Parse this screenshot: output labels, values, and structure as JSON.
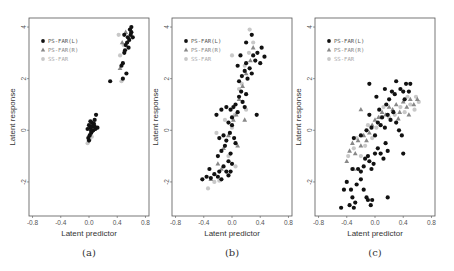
{
  "figure": {
    "panels": [
      {
        "caption": "(a)"
      },
      {
        "caption": "(b)"
      },
      {
        "caption": "(c)"
      }
    ]
  },
  "chart_data": [
    {
      "type": "scatter",
      "title": "(a)",
      "xlabel": "Latent predictor",
      "ylabel": "Latent response",
      "xlim": [
        -0.85,
        0.85
      ],
      "ylim": [
        -3.32,
        4.35
      ],
      "xticks": [
        -0.8,
        -0.4,
        0.0,
        0.4,
        0.8
      ],
      "yticks": [
        -2,
        0,
        2,
        4
      ],
      "grid": false,
      "legend_position": "upper-left",
      "legend": [
        "PS-FAR(L)",
        "PS-FAR(R)",
        "SS-FAR"
      ],
      "series": [
        {
          "name": "PS-FAR(L)",
          "marker": "circle",
          "color": "#111111",
          "points": [
            [
              0.0,
              0.2
            ],
            [
              0.02,
              0.1
            ],
            [
              0.04,
              0.3
            ],
            [
              0.06,
              0.0
            ],
            [
              0.08,
              0.4
            ],
            [
              0.1,
              0.6
            ],
            [
              0.01,
              -0.2
            ],
            [
              0.03,
              -0.1
            ],
            [
              0.05,
              0.15
            ],
            [
              0.07,
              0.25
            ],
            [
              0.0,
              -0.4
            ],
            [
              -0.02,
              0.05
            ],
            [
              0.09,
              0.05
            ],
            [
              0.12,
              0.1
            ],
            [
              0.02,
              0.35
            ],
            [
              0.04,
              -0.05
            ],
            [
              0.06,
              0.2
            ],
            [
              0.08,
              0.15
            ],
            [
              -0.01,
              -0.3
            ],
            [
              0.03,
              0.0
            ],
            [
              0.3,
              1.9
            ],
            [
              0.46,
              2.5
            ],
            [
              0.48,
              2.0
            ],
            [
              0.5,
              3.0
            ],
            [
              0.52,
              3.3
            ],
            [
              0.55,
              3.6
            ],
            [
              0.58,
              3.9
            ],
            [
              0.6,
              3.8
            ],
            [
              0.54,
              3.4
            ],
            [
              0.5,
              3.7
            ],
            [
              0.56,
              3.2
            ],
            [
              0.62,
              3.6
            ],
            [
              0.48,
              2.6
            ],
            [
              0.53,
              2.2
            ],
            [
              0.57,
              3.5
            ],
            [
              0.6,
              4.0
            ],
            [
              0.51,
              3.1
            ],
            [
              0.59,
              3.7
            ]
          ]
        },
        {
          "name": "PS-FAR(R)",
          "marker": "triangle",
          "color": "#888888",
          "points": [
            [
              0.0,
              -0.2
            ],
            [
              0.02,
              0.15
            ],
            [
              0.05,
              0.0
            ],
            [
              0.44,
              2.4
            ],
            [
              0.47,
              3.4
            ],
            [
              0.52,
              3.8
            ]
          ]
        },
        {
          "name": "SS-FAR",
          "marker": "circle",
          "color": "#c8c8c8",
          "points": [
            [
              -0.02,
              -0.5
            ],
            [
              0.01,
              -0.35
            ],
            [
              0.04,
              -0.25
            ],
            [
              0.42,
              3.7
            ],
            [
              0.44,
              2.9
            ],
            [
              0.46,
              1.9
            ],
            [
              0.49,
              3.3
            ]
          ]
        }
      ]
    },
    {
      "type": "scatter",
      "title": "(b)",
      "xlabel": "Latent predictor",
      "ylabel": "Latent response",
      "xlim": [
        -0.85,
        0.85
      ],
      "ylim": [
        -3.32,
        4.35
      ],
      "xticks": [
        -0.8,
        -0.4,
        0.0,
        0.4,
        0.8
      ],
      "yticks": [
        -2,
        0,
        2,
        4
      ],
      "grid": false,
      "legend_position": "upper-left",
      "legend": [
        "PS-FAR(L)",
        "PS-FAR(R)",
        "SS-FAR"
      ],
      "series": [
        {
          "name": "PS-FAR(L)",
          "marker": "circle",
          "color": "#111111",
          "points": [
            [
              -0.42,
              -1.9
            ],
            [
              -0.36,
              -1.8
            ],
            [
              -0.32,
              -1.5
            ],
            [
              -0.3,
              -1.85
            ],
            [
              -0.25,
              -1.7
            ],
            [
              -0.2,
              -1.8
            ],
            [
              -0.18,
              -1.6
            ],
            [
              -0.15,
              -1.9
            ],
            [
              -0.12,
              -1.4
            ],
            [
              -0.08,
              -1.6
            ],
            [
              -0.05,
              -1.75
            ],
            [
              -0.2,
              -1.0
            ],
            [
              -0.15,
              -0.8
            ],
            [
              -0.1,
              -0.6
            ],
            [
              -0.05,
              -1.2
            ],
            [
              -0.02,
              -0.9
            ],
            [
              -0.18,
              -0.3
            ],
            [
              -0.12,
              -0.2
            ],
            [
              -0.08,
              -0.4
            ],
            [
              -0.03,
              -0.1
            ],
            [
              0.0,
              0.2
            ],
            [
              0.03,
              -0.3
            ],
            [
              -0.22,
              0.6
            ],
            [
              -0.15,
              0.8
            ],
            [
              -0.08,
              0.9
            ],
            [
              -0.02,
              0.8
            ],
            [
              0.02,
              0.9
            ],
            [
              0.05,
              1.0
            ],
            [
              0.08,
              0.7
            ],
            [
              0.1,
              1.3
            ],
            [
              0.13,
              1.5
            ],
            [
              0.15,
              1.1
            ],
            [
              0.18,
              0.9
            ],
            [
              0.2,
              1.4
            ],
            [
              0.1,
              1.9
            ],
            [
              0.14,
              2.1
            ],
            [
              0.18,
              2.3
            ],
            [
              0.22,
              2.0
            ],
            [
              0.25,
              2.4
            ],
            [
              0.2,
              2.6
            ],
            [
              0.28,
              2.2
            ],
            [
              0.3,
              2.9
            ],
            [
              0.33,
              2.7
            ],
            [
              0.36,
              3.0
            ],
            [
              0.4,
              2.6
            ],
            [
              0.42,
              3.2
            ],
            [
              0.46,
              2.85
            ],
            [
              0.28,
              3.7
            ],
            [
              0.2,
              3.4
            ],
            [
              0.08,
              2.5
            ],
            [
              0.12,
              2.9
            ],
            [
              0.35,
              0.6
            ],
            [
              0.0,
              0.5
            ],
            [
              -0.05,
              0.3
            ],
            [
              0.05,
              -0.5
            ],
            [
              0.0,
              -1.3
            ],
            [
              -0.02,
              -1.6
            ]
          ]
        },
        {
          "name": "PS-FAR(R)",
          "marker": "triangle",
          "color": "#888888",
          "points": [
            [
              -0.3,
              -1.9
            ],
            [
              -0.2,
              -1.3
            ],
            [
              -0.12,
              -0.7
            ],
            [
              -0.05,
              -0.2
            ],
            [
              0.02,
              0.4
            ],
            [
              0.06,
              0.6
            ],
            [
              0.1,
              1.2
            ],
            [
              0.15,
              1.7
            ],
            [
              0.2,
              2.2
            ],
            [
              0.26,
              2.7
            ],
            [
              0.3,
              3.2
            ],
            [
              0.18,
              0.4
            ],
            [
              -0.15,
              -1.5
            ],
            [
              0.08,
              -0.6
            ]
          ]
        },
        {
          "name": "SS-FAR",
          "marker": "circle",
          "color": "#c8c8c8",
          "points": [
            [
              -0.34,
              -2.25
            ],
            [
              -0.25,
              -2.0
            ],
            [
              -0.18,
              -1.95
            ],
            [
              -0.22,
              -0.1
            ],
            [
              -0.1,
              0.4
            ],
            [
              0.0,
              0.1
            ],
            [
              0.04,
              0.6
            ],
            [
              0.1,
              1.6
            ],
            [
              0.14,
              1.8
            ],
            [
              0.18,
              2.5
            ],
            [
              0.24,
              3.0
            ],
            [
              0.25,
              3.9
            ],
            [
              0.3,
              3.4
            ],
            [
              -0.05,
              -1.0
            ],
            [
              0.05,
              -1.4
            ],
            [
              0.2,
              0.8
            ],
            [
              0.0,
              2.9
            ]
          ]
        }
      ]
    },
    {
      "type": "scatter",
      "title": "(c)",
      "xlabel": "Latent predictor",
      "ylabel": "Latent response",
      "xlim": [
        -0.85,
        0.85
      ],
      "ylim": [
        -3.32,
        4.35
      ],
      "xticks": [
        -0.8,
        -0.4,
        0.0,
        0.4,
        0.8
      ],
      "yticks": [
        -2,
        0,
        2,
        4
      ],
      "grid": false,
      "legend_position": "upper-left",
      "legend": [
        "PS-FAR(L)",
        "PS-FAR(R)",
        "SS-FAR"
      ],
      "series": [
        {
          "name": "PS-FAR(L)",
          "marker": "circle",
          "color": "#111111",
          "points": [
            [
              -0.48,
              -3.0
            ],
            [
              -0.44,
              -2.3
            ],
            [
              -0.4,
              -2.0
            ],
            [
              -0.36,
              -2.9
            ],
            [
              -0.34,
              -2.3
            ],
            [
              -0.32,
              -2.6
            ],
            [
              -0.3,
              -3.0
            ],
            [
              -0.28,
              -2.8
            ],
            [
              -0.26,
              -2.1
            ],
            [
              -0.2,
              -1.9
            ],
            [
              -0.16,
              -2.3
            ],
            [
              -0.12,
              -2.6
            ],
            [
              -0.1,
              -2.7
            ],
            [
              -0.06,
              -2.9
            ],
            [
              -0.04,
              -2.7
            ],
            [
              0.18,
              -2.6
            ],
            [
              -0.32,
              -1.5
            ],
            [
              -0.24,
              -1.5
            ],
            [
              -0.2,
              -1.6
            ],
            [
              -0.16,
              -1.4
            ],
            [
              -0.14,
              -1.1
            ],
            [
              -0.1,
              -1.0
            ],
            [
              -0.08,
              -1.2
            ],
            [
              -0.05,
              -1.5
            ],
            [
              -0.02,
              -1.3
            ],
            [
              0.0,
              -0.9
            ],
            [
              0.04,
              -0.7
            ],
            [
              0.08,
              -0.9
            ],
            [
              0.12,
              -1.1
            ],
            [
              0.15,
              -0.5
            ],
            [
              0.18,
              -0.8
            ],
            [
              0.4,
              -0.9
            ],
            [
              -0.3,
              -0.3
            ],
            [
              -0.2,
              -0.2
            ],
            [
              -0.12,
              0.0
            ],
            [
              -0.05,
              0.1
            ],
            [
              0.0,
              -0.2
            ],
            [
              0.04,
              0.3
            ],
            [
              0.08,
              0.2
            ],
            [
              0.1,
              0.5
            ],
            [
              0.14,
              0.1
            ],
            [
              0.18,
              0.6
            ],
            [
              0.22,
              0.4
            ],
            [
              0.26,
              0.7
            ],
            [
              0.3,
              0.3
            ],
            [
              0.34,
              0.0
            ],
            [
              0.38,
              -0.2
            ],
            [
              -0.08,
              0.6
            ],
            [
              0.02,
              1.3
            ],
            [
              0.06,
              0.8
            ],
            [
              0.16,
              1.0
            ],
            [
              0.2,
              1.2
            ],
            [
              0.24,
              1.5
            ],
            [
              0.28,
              1.4
            ],
            [
              0.3,
              1.9
            ],
            [
              0.36,
              1.6
            ],
            [
              0.4,
              1.5
            ],
            [
              0.44,
              1.8
            ],
            [
              0.48,
              1.5
            ],
            [
              0.5,
              1.8
            ],
            [
              0.42,
              1.2
            ],
            [
              -0.08,
              1.8
            ],
            [
              0.14,
              1.6
            ]
          ]
        },
        {
          "name": "PS-FAR(R)",
          "marker": "triangle",
          "color": "#888888",
          "points": [
            [
              -0.4,
              -1.2
            ],
            [
              -0.36,
              -0.8
            ],
            [
              -0.32,
              -0.5
            ],
            [
              -0.28,
              -0.9
            ],
            [
              -0.24,
              -0.4
            ],
            [
              -0.2,
              -0.6
            ],
            [
              -0.16,
              -0.2
            ],
            [
              -0.12,
              -0.4
            ],
            [
              -0.08,
              -0.1
            ],
            [
              -0.04,
              0.2
            ],
            [
              0.0,
              0.4
            ],
            [
              0.05,
              0.5
            ],
            [
              0.1,
              0.7
            ],
            [
              0.15,
              0.6
            ],
            [
              0.2,
              0.9
            ],
            [
              0.25,
              0.8
            ],
            [
              0.3,
              1.0
            ],
            [
              0.35,
              0.7
            ],
            [
              0.4,
              1.1
            ],
            [
              0.45,
              0.9
            ],
            [
              0.5,
              1.2
            ],
            [
              0.55,
              1.0
            ],
            [
              0.6,
              1.2
            ],
            [
              -0.2,
              0.8
            ],
            [
              -0.3,
              -1.5
            ],
            [
              0.33,
              0.45
            ],
            [
              0.48,
              0.6
            ]
          ]
        },
        {
          "name": "SS-FAR",
          "marker": "circle",
          "color": "#c8c8c8",
          "points": [
            [
              -0.38,
              -1.0
            ],
            [
              -0.3,
              -0.7
            ],
            [
              -0.26,
              -0.3
            ],
            [
              -0.2,
              -1.0
            ],
            [
              -0.14,
              -0.6
            ],
            [
              -0.1,
              0.2
            ],
            [
              -0.04,
              -0.3
            ],
            [
              0.02,
              0.1
            ],
            [
              0.08,
              0.5
            ],
            [
              0.12,
              0.9
            ],
            [
              0.2,
              0.5
            ],
            [
              0.28,
              0.6
            ],
            [
              0.36,
              0.9
            ],
            [
              0.42,
              0.7
            ],
            [
              0.5,
              1.0
            ],
            [
              0.56,
              0.8
            ],
            [
              0.62,
              1.1
            ],
            [
              0.58,
              1.3
            ],
            [
              0.46,
              1.3
            ]
          ]
        }
      ]
    }
  ]
}
